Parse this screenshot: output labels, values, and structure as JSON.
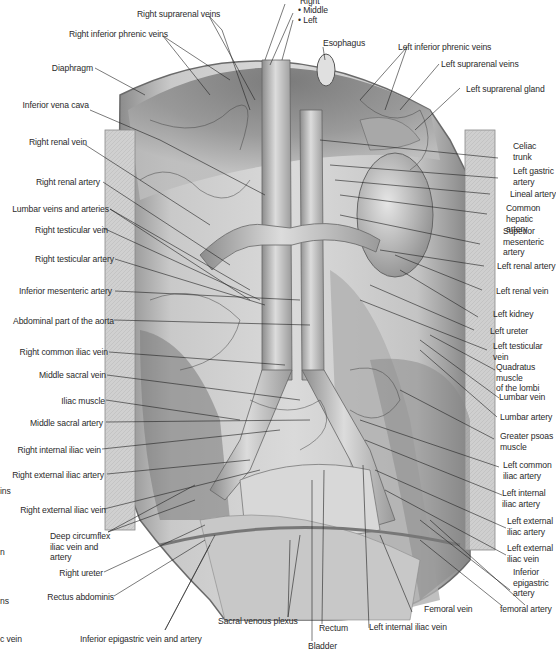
{
  "figure": {
    "colors": {
      "background": "#ffffff",
      "tissue_dark": "#5a5a5a",
      "tissue_mid": "#9a9a9a",
      "tissue_light": "#d6d6d6",
      "vessel": "#b8b8b8",
      "leader_line": "#222222",
      "label_text": "#2a2a2a"
    }
  },
  "labels": {
    "top": {
      "right_suprarenal_veins": "Right suprarenal veins",
      "right_inferior_phrenic_veins": "Right inferior phrenic veins",
      "hepatic_veins_right": "Right",
      "hepatic_veins_middle": "• Middle",
      "hepatic_veins_left": "• Left",
      "esophagus": "Esophagus",
      "left_inferior_phrenic_veins": "Left inferior phrenic veins",
      "left_suprarenal_veins": "Left suprarenal veins",
      "left_suprarenal_gland": "Left suprarenal gland"
    },
    "left": [
      {
        "id": "diaphragm",
        "text": "Diaphragm"
      },
      {
        "id": "inferior_vena_cava",
        "text": "Inferior vena cava"
      },
      {
        "id": "right_renal_vein",
        "text": "Right renal vein"
      },
      {
        "id": "right_renal_artery",
        "text": "Right renal artery"
      },
      {
        "id": "lumbar_veins_arteries",
        "text": "Lumbar veins and arteries"
      },
      {
        "id": "right_testicular_vein",
        "text": "Right testicular vein"
      },
      {
        "id": "right_testicular_artery",
        "text": "Right testicular artery"
      },
      {
        "id": "inferior_mesenteric_artery",
        "text": "Inferior mesenteric artery"
      },
      {
        "id": "abdominal_aorta",
        "text": "Abdominal part of the aorta"
      },
      {
        "id": "right_common_iliac_vein",
        "text": "Right common iliac vein"
      },
      {
        "id": "middle_sacral_vein",
        "text": "Middle sacral vein"
      },
      {
        "id": "iliac_muscle",
        "text": "Iliac muscle"
      },
      {
        "id": "middle_sacral_artery",
        "text": "Middle sacral artery"
      },
      {
        "id": "right_internal_iliac_vein",
        "text": "Right internal iliac vein"
      },
      {
        "id": "right_external_iliac_artery",
        "text": "Right external iliac artery"
      },
      {
        "id": "right_external_iliac_vein",
        "text": "Right external iliac vein"
      },
      {
        "id": "deep_circumflex_iliac",
        "text": "Deep circumflex\niliac vein and\nartery"
      },
      {
        "id": "right_ureter",
        "text": "Right ureter"
      },
      {
        "id": "rectus_abdominis",
        "text": "Rectus abdominis"
      }
    ],
    "clipped_left_edge": [
      "ins",
      "n",
      "ns",
      "c vein"
    ],
    "right": [
      {
        "id": "celiac_trunk",
        "text": "Celiac\ntrunk"
      },
      {
        "id": "left_gastric_artery",
        "text": "Left gastric\nartery"
      },
      {
        "id": "lineal_artery",
        "text": "Lineal artery"
      },
      {
        "id": "common_hepatic_artery",
        "text": "Common\nhepatic artery"
      },
      {
        "id": "superior_mesenteric_artery",
        "text": "Superior\nmesenteric\nartery"
      },
      {
        "id": "left_renal_artery",
        "text": "Left renal artery"
      },
      {
        "id": "left_renal_vein",
        "text": "Left renal vein"
      },
      {
        "id": "left_kidney",
        "text": "Left kidney"
      },
      {
        "id": "left_ureter",
        "text": "Left ureter"
      },
      {
        "id": "left_testicular_vein",
        "text": "Left testicular\nvein"
      },
      {
        "id": "quadratus_lumborum",
        "text": "Quadratus muscle\nof the lombi"
      },
      {
        "id": "lumbar_vein",
        "text": "Lumbar vein"
      },
      {
        "id": "lumbar_artery",
        "text": "Lumbar artery"
      },
      {
        "id": "greater_psoas",
        "text": "Greater psoas\nmuscle"
      },
      {
        "id": "left_common_iliac_artery",
        "text": "Left common\niliac artery"
      },
      {
        "id": "left_internal_iliac_artery",
        "text": "Left internal\niliac artery"
      },
      {
        "id": "left_external_iliac_artery",
        "text": "Left external\niliac artery"
      },
      {
        "id": "left_external_iliac_vein",
        "text": "Left external\niliac vein"
      },
      {
        "id": "inferior_epigastric_artery",
        "text": "Inferior\nepigastric\nartery"
      },
      {
        "id": "femoral_artery",
        "text": "femoral artery"
      }
    ],
    "bottom": {
      "inferior_epigastric_vein_artery": "Inferior epigastric vein and artery",
      "sacral_venous_plexus": "Sacral venous plexus",
      "rectum": "Rectum",
      "bladder": "Bladder",
      "left_internal_iliac_vein": "Left internal iliac vein",
      "femoral_vein": "Femoral vein"
    }
  }
}
